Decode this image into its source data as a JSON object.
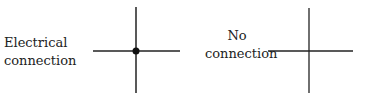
{
  "diagram": {
    "left": {
      "label_line1": "Electrical",
      "label_line2": "connection",
      "symbol": "crossing-wires-with-junction-dot"
    },
    "right": {
      "label_line1": "No",
      "label_line2": "connection",
      "symbol": "crossing-wires-without-junction"
    },
    "colors": {
      "line": "#222222",
      "text": "#222222",
      "background": "#ffffff"
    }
  }
}
